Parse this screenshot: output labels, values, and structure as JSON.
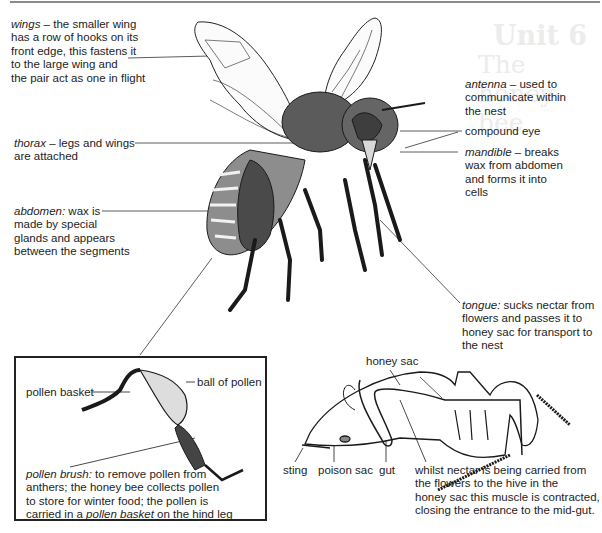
{
  "ghost": {
    "unit": "Unit 6",
    "title": "The honey-bee"
  },
  "labels": {
    "wings": {
      "term": "wings",
      "sep": " – ",
      "lines": [
        "the smaller wing",
        "has a row of hooks on its",
        "front edge, this fastens it",
        "to the large wing and",
        "the pair act as one in flight"
      ]
    },
    "thorax": {
      "term": "thorax",
      "sep": " – ",
      "lines": [
        "legs and wings",
        "are attached"
      ]
    },
    "abdomen": {
      "term": "abdomen:",
      "sep": " ",
      "lines": [
        "wax is",
        "made by special",
        "glands and appears",
        "between the segments"
      ]
    },
    "antenna": {
      "term": "antenna",
      "sep": " – ",
      "lines": [
        "used to",
        "communicate within",
        "the nest"
      ]
    },
    "compound_eye": {
      "text": "compound eye"
    },
    "mandible": {
      "term": "mandible",
      "sep": " – ",
      "lines": [
        "breaks",
        "wax from abdomen",
        "and forms it into",
        "cells"
      ]
    },
    "tongue": {
      "term": "tongue:",
      "sep": " ",
      "lines": [
        "sucks nectar from",
        "flowers and passes it to",
        "honey sac for transport to",
        "the nest"
      ]
    }
  },
  "leg_inset": {
    "pollen_basket": "pollen basket",
    "ball_of_pollen": "ball of pollen",
    "pollen_brush": {
      "term": "pollen brush:",
      "line1": "to remove pollen from",
      "line2": "anthers; the honey bee collects pollen",
      "line3": "to store for winter food; the pollen is",
      "line4_pre": "carried in a ",
      "line4_term": "pollen basket",
      "line4_post": " on the hind leg"
    }
  },
  "section": {
    "honey_sac": "honey sac",
    "sting": "sting",
    "poison_sac": "poison sac",
    "gut": "gut",
    "muscle_note": [
      "whilst nectar is being carried from",
      "the flowers to the hive in the",
      "honey sac this muscle is contracted,",
      "closing the entrance to the mid-gut."
    ]
  }
}
